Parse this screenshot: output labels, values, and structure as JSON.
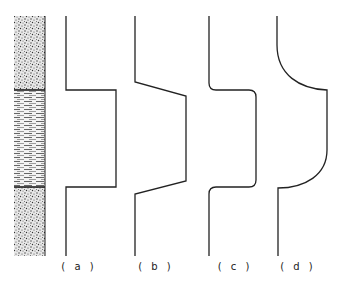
{
  "figure": {
    "lithology_column": {
      "layers": [
        {
          "name": "upper-sand",
          "pattern": "stipple",
          "y_top": 16,
          "y_bottom": 90
        },
        {
          "name": "middle-shale",
          "pattern": "horizontal-dash",
          "y_top": 90,
          "y_bottom": 187
        },
        {
          "name": "lower-sand",
          "pattern": "stipple",
          "y_top": 187,
          "y_bottom": 256
        }
      ]
    },
    "curves": [
      {
        "id": "a",
        "label": "( a )",
        "shape": "square step"
      },
      {
        "id": "b",
        "label": "( b )",
        "shape": "trapezoidal (sloped transitions)"
      },
      {
        "id": "c",
        "label": "( c )",
        "shape": "rounded step"
      },
      {
        "id": "d",
        "label": "( d )",
        "shape": "asymmetric curved step"
      }
    ],
    "colors": {
      "line": "#222222",
      "background": "#ffffff"
    }
  }
}
